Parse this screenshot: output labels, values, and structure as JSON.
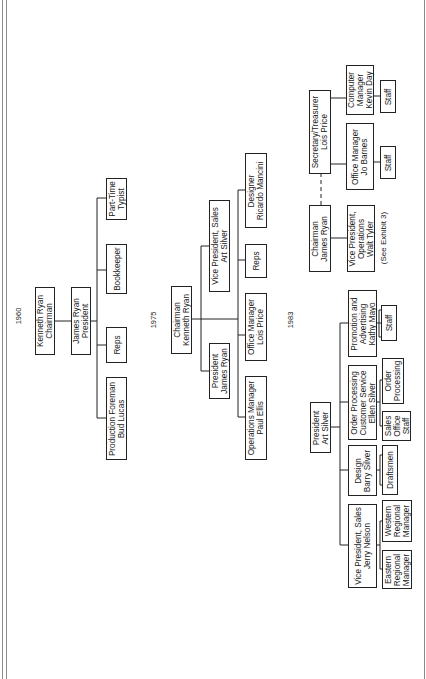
{
  "charts": {
    "c1960": {
      "year": "1960",
      "chairman": "Kenneth Ryan\nChairman",
      "president": "James Ryan\nPresident",
      "production_foreman": "Production Foreman\nBud Lucas",
      "reps": "Reps",
      "bookkeeper": "Bookkeeper",
      "part_time_typist": "Part-Time\nTypist"
    },
    "c1975": {
      "year": "1975",
      "chairman": "Chairman\nKenneth Ryan",
      "president": "President\nJames Ryan",
      "vp_sales": "Vice President, Sales\nArt Silver",
      "operations_manager": "Operations Manager\nPaul Ellis",
      "office_manager": "Office Manager\nLois Price",
      "reps": "Reps",
      "designer": "Designer\nRicardo Mancini"
    },
    "c1983": {
      "year": "1983",
      "president": "President\nArt Silver",
      "vp_sales": "Vice President, Sales\nJerry Nelson",
      "eastern_rm": "Eastern\nRegional\nManager",
      "western_rm": "Western\nRegional\nManager",
      "design": "Design\nBarry Silver",
      "draftsmen": "Draftsmen",
      "order_processing_cs": "Order Processing\nCustomer Service\nEllen Silver",
      "sales_office_staff": "Sales\nOffice\nStaff",
      "order_processing": "Order\nProcessing",
      "promotion": "Promotion and\nAdvertising\nKathy Mayo",
      "promotion_staff": "Staff",
      "chairman": "Chairman\nJames Ryan",
      "vp_operations": "Vice President,\nOperations\nWalt Tyler",
      "see_exhibit": "(See Exhibit 3)",
      "secretary_treasurer": "Secretary/Treasurer\nLois Price",
      "office_manager": "Office Manager\nJo Barnes",
      "office_staff": "Staff",
      "computer_manager": "Computer\nManager\nKevin Day",
      "computer_staff": "Staff"
    }
  }
}
